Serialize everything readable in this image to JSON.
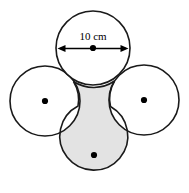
{
  "figure": {
    "name": "four-tangent-circles-diagram",
    "width": 189,
    "height": 193,
    "background_color": "#ffffff",
    "stroke_color": "#1a1a1a",
    "shaded_fill_color": "#e3e3e3",
    "unshaded_fill_color": "#ffffff",
    "center_dot_color": "#000000",
    "dimension": {
      "label": "10 cm",
      "value": 10,
      "unit": "cm",
      "measures": "diameter",
      "applies_to": "top-circle",
      "arrow_style": "double-headed"
    },
    "circles": [
      {
        "id": "top-circle",
        "position": "top",
        "cx": 93,
        "cy": 48,
        "r": 37,
        "fill": "unshaded",
        "has_center_dot": true,
        "labeled": true
      },
      {
        "id": "left-circle",
        "position": "left",
        "cx": 45,
        "cy": 101,
        "r": 35,
        "fill": "unshaded",
        "has_center_dot": true,
        "labeled": false
      },
      {
        "id": "right-circle",
        "position": "right",
        "cx": 144,
        "cy": 100,
        "r": 35,
        "fill": "unshaded",
        "has_center_dot": true,
        "labeled": false
      },
      {
        "id": "bottom-circle",
        "position": "bottom",
        "cx": 94,
        "cy": 155,
        "r": 34,
        "fill": "shaded",
        "has_center_dot": true,
        "labeled": false
      }
    ],
    "shaded_region": {
      "description": "bottom circle plus curved neck bounded by arcs of the top, left and right circles",
      "fill": "#e3e3e3"
    }
  }
}
